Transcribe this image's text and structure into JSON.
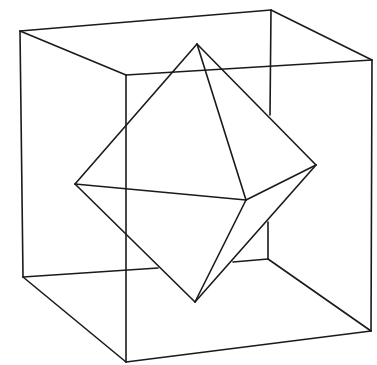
{
  "colors": {
    "line": "#1a1a1a",
    "background": "#ffffff"
  },
  "cube": {
    "vertices": {
      "back_top_left": [
        20,
        31
      ],
      "back_top_right": [
        271,
        10
      ],
      "front_top_left": [
        126,
        75
      ],
      "front_top_right": [
        372,
        60
      ],
      "back_bottom_left": [
        23,
        277
      ],
      "back_bottom_right": [
        268,
        259
      ],
      "front_bottom_left": [
        126,
        362
      ],
      "front_bottom_right": [
        371,
        331
      ]
    },
    "visible_segments": [
      [
        [
          20,
          31
        ],
        [
          271,
          10
        ]
      ],
      [
        [
          271,
          10
        ],
        [
          372,
          60
        ]
      ],
      [
        [
          20,
          31
        ],
        [
          126,
          75
        ]
      ],
      [
        [
          126,
          75
        ],
        [
          372,
          60
        ]
      ],
      [
        [
          20,
          31
        ],
        [
          23,
          277
        ]
      ],
      [
        [
          126,
          75
        ],
        [
          126,
          362
        ]
      ],
      [
        [
          372,
          60
        ],
        [
          371,
          331
        ]
      ],
      [
        [
          23,
          277
        ],
        [
          126,
          362
        ]
      ],
      [
        [
          126,
          362
        ],
        [
          371,
          331
        ]
      ],
      [
        [
          268,
          259
        ],
        [
          371,
          331
        ]
      ],
      [
        [
          271,
          10
        ],
        [
          270,
          115
        ]
      ],
      [
        [
          268,
          222
        ],
        [
          268,
          259
        ]
      ],
      [
        [
          23,
          277
        ],
        [
          158,
          268
        ]
      ],
      [
        [
          233,
          262
        ],
        [
          268,
          259
        ]
      ]
    ]
  },
  "octahedron": {
    "vertices": {
      "top": [
        197,
        44
      ],
      "left": [
        75,
        184
      ],
      "right": [
        316,
        165
      ],
      "front": [
        246,
        200
      ],
      "bottom": [
        195,
        302
      ]
    },
    "visible_segments": [
      [
        [
          197,
          44
        ],
        [
          75,
          184
        ]
      ],
      [
        [
          197,
          44
        ],
        [
          316,
          165
        ]
      ],
      [
        [
          197,
          44
        ],
        [
          246,
          200
        ]
      ],
      [
        [
          75,
          184
        ],
        [
          246,
          200
        ]
      ],
      [
        [
          246,
          200
        ],
        [
          316,
          165
        ]
      ],
      [
        [
          75,
          184
        ],
        [
          195,
          302
        ]
      ],
      [
        [
          246,
          200
        ],
        [
          195,
          302
        ]
      ],
      [
        [
          316,
          165
        ],
        [
          195,
          302
        ]
      ]
    ]
  }
}
